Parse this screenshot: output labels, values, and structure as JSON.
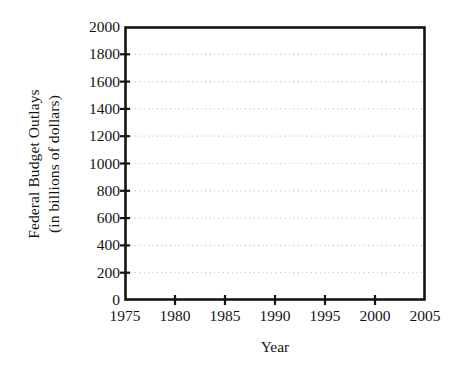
{
  "chart_data": {
    "type": "line",
    "title": "",
    "subtitle": "",
    "xlabel": "Year",
    "ylabel_line1": "Federal Budget Outlays",
    "ylabel_line2": "(in billions of dollars)",
    "ylabel": "Federal Budget Outlays (in billions of dollars)",
    "xlim": [
      1975,
      2005
    ],
    "ylim": [
      0,
      2000
    ],
    "xticks": [
      1975,
      1980,
      1985,
      1990,
      1995,
      2000,
      2005
    ],
    "xtick_labels": [
      "1975",
      "1980",
      "1985",
      "1990",
      "1995",
      "2000",
      "2005"
    ],
    "yticks": [
      0,
      200,
      400,
      600,
      800,
      1000,
      1200,
      1400,
      1600,
      1800,
      2000
    ],
    "ytick_labels": [
      "0",
      "200",
      "400",
      "600",
      "800",
      "1000",
      "1200",
      "1400",
      "1600",
      "1800",
      "2000"
    ],
    "grid": "horizontal-dotted",
    "legend": "none",
    "series": [],
    "values": [],
    "categories": [],
    "annotations": [],
    "note": "Empty coordinate grid; no data series plotted."
  },
  "style": {
    "background": "#ffffff",
    "axis_color": "#151515",
    "text_color": "#141414",
    "grid_color": "#c9c9c9"
  },
  "geometry": {
    "plot_left": 125,
    "plot_right": 425,
    "plot_top": 27,
    "plot_bottom": 300
  }
}
